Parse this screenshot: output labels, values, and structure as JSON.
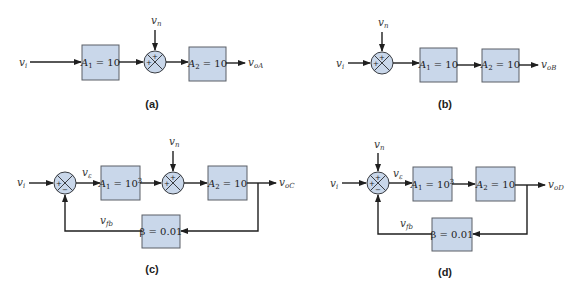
{
  "colors": {
    "block_fill": "#c9d7ea",
    "line": "#1f1f1f"
  },
  "diagrams": {
    "a": {
      "caption": "(a)",
      "input": "v",
      "input_sub": "i",
      "noise": "v",
      "noise_sub": "n",
      "block1": {
        "name": "A",
        "sub": "1",
        "value": " = 10"
      },
      "block2": {
        "name": "A",
        "sub": "2",
        "value": " = 10"
      },
      "output": "v",
      "output_sub": "oA",
      "sum_signs": {
        "top": "+",
        "left": "+"
      }
    },
    "b": {
      "caption": "(b)",
      "input": "v",
      "input_sub": "i",
      "noise": "v",
      "noise_sub": "n",
      "block1": {
        "name": "A",
        "sub": "1",
        "value": " = 10"
      },
      "block2": {
        "name": "A",
        "sub": "2",
        "value": " = 10"
      },
      "output": "v",
      "output_sub": "oB",
      "sum_signs": {
        "top": "+",
        "left": "+"
      }
    },
    "c": {
      "caption": "(c)",
      "input": "v",
      "input_sub": "i",
      "error": "v",
      "error_sub": "ε",
      "noise": "v",
      "noise_sub": "n",
      "block1": {
        "name": "A",
        "sub": "1",
        "value": " = 10",
        "sup": "3"
      },
      "block2": {
        "name": "A",
        "sub": "2",
        "value": " = 10"
      },
      "feedback_block": {
        "text": "β = 0.01"
      },
      "feedback": "v",
      "feedback_sub": "fb",
      "output": "v",
      "output_sub": "oC",
      "sum1_signs": {
        "left": "+",
        "bottom": "−"
      },
      "sum2_signs": {
        "top": "+",
        "left": "+"
      }
    },
    "d": {
      "caption": "(d)",
      "input": "v",
      "input_sub": "i",
      "error": "v",
      "error_sub": "ε",
      "noise": "v",
      "noise_sub": "n",
      "block1": {
        "name": "A",
        "sub": "1",
        "value": " = 10",
        "sup": "3"
      },
      "block2": {
        "name": "A",
        "sub": "2",
        "value": " = 10"
      },
      "feedback_block": {
        "text": "β = 0.01"
      },
      "feedback": "v",
      "feedback_sub": "fb",
      "output": "v",
      "output_sub": "oD",
      "sum_signs": {
        "top": "+",
        "left": "+",
        "bottom": "−"
      }
    }
  }
}
